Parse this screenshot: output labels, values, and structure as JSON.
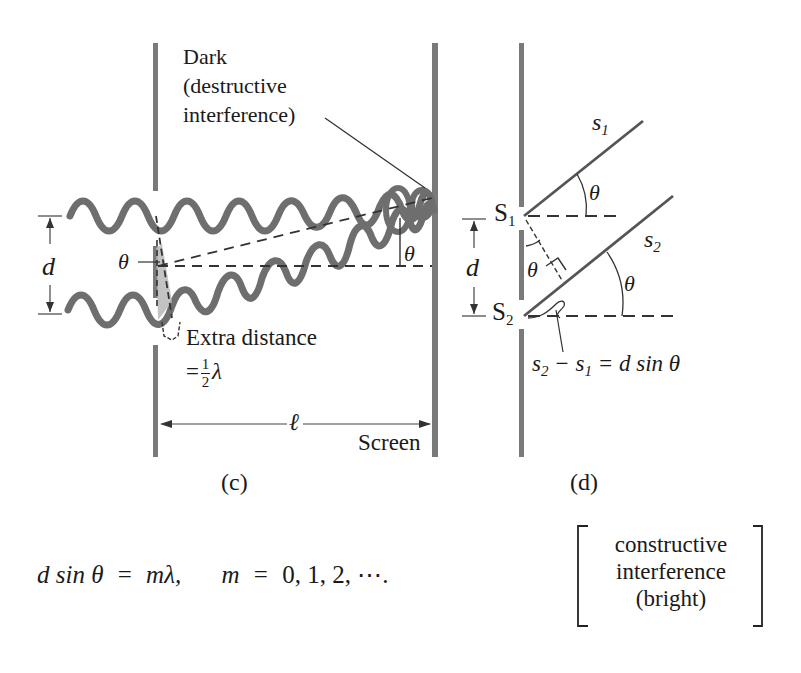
{
  "figure": {
    "panel_c": {
      "caption": "(c)",
      "dark_label": [
        "Dark",
        "(destructive",
        "interference)"
      ],
      "extra_distance_label": "Extra distance",
      "extra_distance_eq_prefix": "=",
      "extra_distance_frac_num": "1",
      "extra_distance_frac_den": "2",
      "extra_distance_symbol": "λ",
      "d_label": "d",
      "theta_left": "θ",
      "theta_right": "θ",
      "ell_label": "ℓ",
      "screen_label": "Screen"
    },
    "panel_d": {
      "caption": "(d)",
      "s1_ray": "s",
      "s1_ray_sub": "1",
      "s2_ray": "s",
      "s2_ray_sub": "2",
      "S1": "S",
      "S1_sub": "1",
      "S2": "S",
      "S2_sub": "2",
      "d_label": "d",
      "theta_top": "θ",
      "theta_mid": "θ",
      "theta_bottom": "θ",
      "path_diff": {
        "a": "s",
        "a_sub": "2",
        "minus": " − ",
        "b": "s",
        "b_sub": "1",
        "rest": " = d sin θ"
      }
    },
    "equation": {
      "lhs": "d sin θ",
      "eq1": "=",
      "rhs": "mλ,",
      "m": "m",
      "eq2": "=",
      "values": "0, 1, 2, ⋯."
    },
    "condition_note": [
      "constructive",
      "interference",
      "(bright)"
    ],
    "colors": {
      "wave": "#6e6e6e",
      "barrier": "#7a7a7a",
      "line": "#333333",
      "shade": "#b8b8b8"
    }
  }
}
